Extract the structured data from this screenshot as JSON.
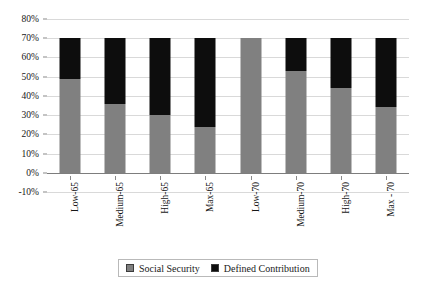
{
  "chart_data": {
    "type": "bar",
    "stacked": true,
    "title": "",
    "subtitle": "",
    "xlabel": "",
    "ylabel": "",
    "ylim": [
      -10,
      80
    ],
    "ytick_values": [
      80,
      70,
      60,
      50,
      40,
      30,
      20,
      10,
      0,
      -10
    ],
    "ytick_labels": [
      "80%",
      "70%",
      "60%",
      "50%",
      "40%",
      "30%",
      "20%",
      "10%",
      "0%",
      "-10%"
    ],
    "grid": true,
    "legend_position": "bottom",
    "categories": [
      "Low-65",
      "Medium-65",
      "High-65",
      "Max-65",
      "Low-70",
      "Medium-70",
      "High-70",
      "Max - 70"
    ],
    "series": [
      {
        "name": "Social Security",
        "color": "#808080",
        "values": [
          49,
          36,
          30,
          24,
          70,
          53,
          44,
          34
        ]
      },
      {
        "name": "Defined Contribution",
        "color": "#0d0d0d",
        "values": [
          21,
          34,
          40,
          46,
          0,
          17,
          26,
          36
        ]
      }
    ],
    "totals": [
      70,
      70,
      70,
      70,
      70,
      70,
      70,
      70
    ]
  },
  "legend": {
    "items": [
      {
        "label": "Social Security",
        "color": "#808080"
      },
      {
        "label": "Defined Contribution",
        "color": "#0d0d0d"
      }
    ]
  }
}
